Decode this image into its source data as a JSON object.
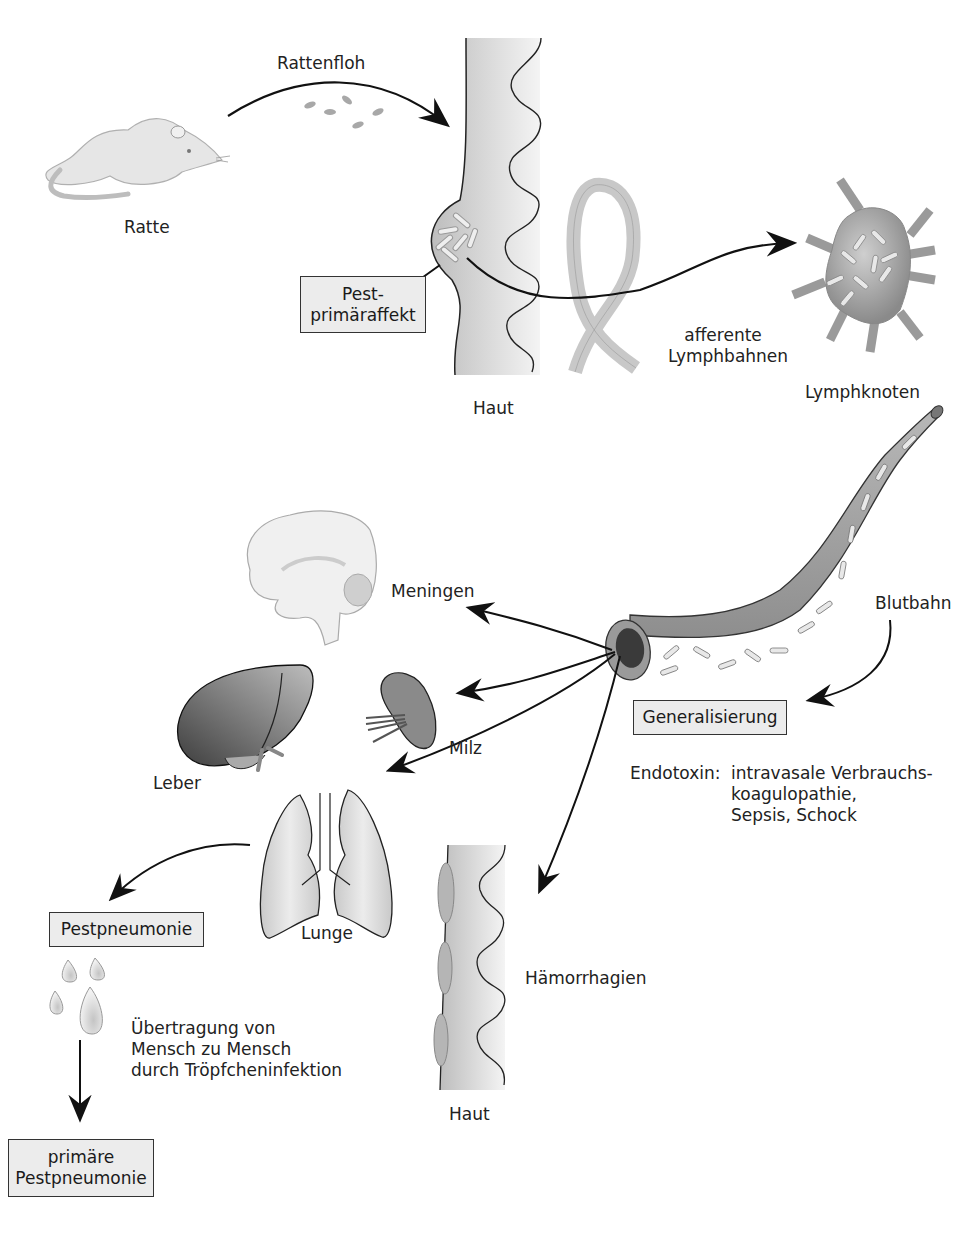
{
  "diagram": {
    "colors": {
      "tissue": "#d4d4d4",
      "organ_dark": "#7a7a7a",
      "box_fill": "#ececec",
      "line": "#111111"
    },
    "labels": {
      "rat": "Ratte",
      "flea": "Rattenfloh",
      "skin_top": "Haut",
      "lymph_vessels_line1": "afferente",
      "lymph_vessels_line2": "Lymphbahnen",
      "lymph_node": "Lymphknoten",
      "bloodstream": "Blutbahn",
      "meninges": "Meningen",
      "liver": "Leber",
      "spleen": "Milz",
      "lung": "Lunge",
      "hemorrhages": "Hämorrhagien",
      "skin_bottom": "Haut",
      "endotoxin_key": "Endotoxin:",
      "endotoxin_line1": "intravasale Verbrauchs-",
      "endotoxin_line2": "koagulopathie,",
      "endotoxin_line3": "Sepsis, Schock",
      "transmission_line1": "Übertragung von",
      "transmission_line2": "Mensch zu Mensch",
      "transmission_line3": "durch Tröpfcheninfektion"
    },
    "boxes": {
      "primary_affect_line1": "Pest-",
      "primary_affect_line2": "primäraffekt",
      "generalization": "Generalisierung",
      "plague_pneumonia": "Pestpneumonie",
      "primary_pneumonia_line1": "primäre",
      "primary_pneumonia_line2": "Pestpneumonie"
    },
    "icons": [
      "rat-icon",
      "flea-icon",
      "skin-section-icon",
      "lymph-vessel-icon",
      "lymph-node-icon",
      "blood-vessel-icon",
      "brain-icon",
      "liver-icon",
      "spleen-icon",
      "lung-icon",
      "droplet-icon",
      "skin-hemorrhage-icon",
      "arrow-icon"
    ]
  }
}
